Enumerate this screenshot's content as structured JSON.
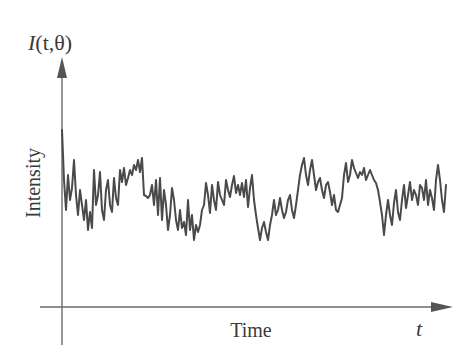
{
  "chart_data": {
    "type": "line",
    "title": "",
    "ylabel": "Intensity",
    "xlabel": "Time",
    "y_axis_symbol": "I(t,θ)",
    "x_axis_symbol": "t",
    "grid": false,
    "legend": null,
    "ticks": "none",
    "series": [
      {
        "name": "I(t,θ)",
        "color": "#4a4a4a",
        "points_px": [
          [
            62,
            130
          ],
          [
            64,
            180
          ],
          [
            66,
            210
          ],
          [
            68,
            175
          ],
          [
            70,
            200
          ],
          [
            72,
            188
          ],
          [
            74,
            160
          ],
          [
            76,
            195
          ],
          [
            78,
            215
          ],
          [
            80,
            190
          ],
          [
            82,
            205
          ],
          [
            84,
            220
          ],
          [
            86,
            200
          ],
          [
            88,
            230
          ],
          [
            90,
            212
          ],
          [
            92,
            228
          ],
          [
            94,
            170
          ],
          [
            96,
            205
          ],
          [
            98,
            195
          ],
          [
            100,
            172
          ],
          [
            102,
            210
          ],
          [
            104,
            220
          ],
          [
            106,
            190
          ],
          [
            108,
            180
          ],
          [
            110,
            205
          ],
          [
            112,
            212
          ],
          [
            114,
            178
          ],
          [
            116,
            198
          ],
          [
            118,
            205
          ],
          [
            120,
            170
          ],
          [
            122,
            182
          ],
          [
            124,
            168
          ],
          [
            126,
            185
          ],
          [
            128,
            178
          ],
          [
            130,
            170
          ],
          [
            132,
            175
          ],
          [
            134,
            165
          ],
          [
            136,
            170
          ],
          [
            138,
            160
          ],
          [
            140,
            172
          ],
          [
            142,
            158
          ],
          [
            144,
            195
          ],
          [
            146,
            196
          ],
          [
            148,
            198
          ],
          [
            150,
            195
          ],
          [
            152,
            185
          ],
          [
            154,
            205
          ],
          [
            156,
            180
          ],
          [
            158,
            215
          ],
          [
            160,
            178
          ],
          [
            162,
            220
          ],
          [
            164,
            190
          ],
          [
            166,
            205
          ],
          [
            168,
            230
          ],
          [
            170,
            215
          ],
          [
            172,
            188
          ],
          [
            174,
            200
          ],
          [
            176,
            220
          ],
          [
            178,
            230
          ],
          [
            180,
            210
          ],
          [
            182,
            228
          ],
          [
            184,
            222
          ],
          [
            186,
            235
          ],
          [
            188,
            200
          ],
          [
            190,
            230
          ],
          [
            192,
            215
          ],
          [
            194,
            240
          ],
          [
            196,
            225
          ],
          [
            198,
            232
          ],
          [
            200,
            225
          ],
          [
            202,
            210
          ],
          [
            204,
            205
          ],
          [
            206,
            183
          ],
          [
            208,
            195
          ],
          [
            210,
            213
          ],
          [
            212,
            185
          ],
          [
            214,
            200
          ],
          [
            216,
            210
          ],
          [
            218,
            182
          ],
          [
            220,
            195
          ],
          [
            222,
            200
          ],
          [
            224,
            205
          ],
          [
            226,
            180
          ],
          [
            228,
            190
          ],
          [
            230,
            197
          ],
          [
            232,
            185
          ],
          [
            234,
            176
          ],
          [
            236,
            193
          ],
          [
            238,
            185
          ],
          [
            240,
            195
          ],
          [
            242,
            183
          ],
          [
            244,
            197
          ],
          [
            246,
            180
          ],
          [
            248,
            207
          ],
          [
            250,
            188
          ],
          [
            252,
            175
          ],
          [
            254,
            200
          ],
          [
            256,
            215
          ],
          [
            258,
            228
          ],
          [
            260,
            240
          ],
          [
            262,
            228
          ],
          [
            264,
            222
          ],
          [
            266,
            232
          ],
          [
            268,
            240
          ],
          [
            270,
            225
          ],
          [
            272,
            215
          ],
          [
            274,
            200
          ],
          [
            276,
            215
          ],
          [
            278,
            210
          ],
          [
            280,
            198
          ],
          [
            282,
            210
          ],
          [
            284,
            218
          ],
          [
            286,
            212
          ],
          [
            288,
            200
          ],
          [
            290,
            195
          ],
          [
            292,
            210
          ],
          [
            294,
            218
          ],
          [
            296,
            205
          ],
          [
            298,
            190
          ],
          [
            300,
            175
          ],
          [
            302,
            165
          ],
          [
            304,
            158
          ],
          [
            306,
            175
          ],
          [
            308,
            185
          ],
          [
            310,
            170
          ],
          [
            312,
            160
          ],
          [
            314,
            175
          ],
          [
            316,
            190
          ],
          [
            318,
            182
          ],
          [
            320,
            178
          ],
          [
            322,
            190
          ],
          [
            324,
            198
          ],
          [
            326,
            185
          ],
          [
            328,
            182
          ],
          [
            330,
            192
          ],
          [
            332,
            205
          ],
          [
            334,
            195
          ],
          [
            336,
            210
          ],
          [
            338,
            212
          ],
          [
            340,
            205
          ],
          [
            342,
            198
          ],
          [
            344,
            175
          ],
          [
            346,
            163
          ],
          [
            348,
            182
          ],
          [
            350,
            175
          ],
          [
            352,
            160
          ],
          [
            354,
            168
          ],
          [
            356,
            173
          ],
          [
            358,
            178
          ],
          [
            360,
            172
          ],
          [
            362,
            175
          ],
          [
            364,
            168
          ],
          [
            366,
            180
          ],
          [
            368,
            175
          ],
          [
            370,
            170
          ],
          [
            372,
            175
          ],
          [
            374,
            180
          ],
          [
            376,
            183
          ],
          [
            378,
            190
          ],
          [
            380,
            202
          ],
          [
            382,
            215
          ],
          [
            384,
            235
          ],
          [
            386,
            215
          ],
          [
            388,
            200
          ],
          [
            390,
            215
          ],
          [
            392,
            225
          ],
          [
            394,
            203
          ],
          [
            396,
            190
          ],
          [
            398,
            212
          ],
          [
            400,
            220
          ],
          [
            402,
            200
          ],
          [
            404,
            185
          ],
          [
            406,
            208
          ],
          [
            408,
            195
          ],
          [
            410,
            182
          ],
          [
            412,
            200
          ],
          [
            414,
            190
          ],
          [
            416,
            195
          ],
          [
            418,
            205
          ],
          [
            420,
            185
          ],
          [
            422,
            188
          ],
          [
            424,
            200
          ],
          [
            426,
            180
          ],
          [
            428,
            205
          ],
          [
            430,
            190
          ],
          [
            432,
            198
          ],
          [
            434,
            210
          ],
          [
            436,
            180
          ],
          [
            438,
            165
          ],
          [
            440,
            180
          ],
          [
            442,
            200
          ],
          [
            444,
            212
          ],
          [
            446,
            185
          ]
        ]
      }
    ],
    "axes_px": {
      "y_axis": {
        "x": 62,
        "y_top": 58,
        "y_bottom": 345
      },
      "x_axis": {
        "y": 307,
        "x_left": 40,
        "x_right": 452
      }
    }
  },
  "labels": {
    "y_symbol_prefix": "I",
    "y_symbol_args": "(t,θ)",
    "y_label": "Intensity",
    "x_label": "Time",
    "x_symbol": "t"
  },
  "colors": {
    "axis": "#6a6a6a",
    "signal": "#4a4a4a",
    "text": "#3a3a3a"
  }
}
